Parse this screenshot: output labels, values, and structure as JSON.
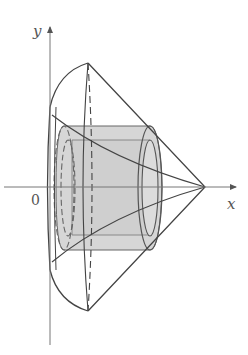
{
  "diagram": {
    "type": "solid-of-revolution",
    "axes": {
      "x_label": "x",
      "y_label": "y",
      "origin_label": "0"
    },
    "colors": {
      "line": "#444444",
      "axis": "#666666",
      "shade": "#d4d4d4",
      "shade_dark": "#bdbdbd",
      "label": "#555555"
    }
  }
}
